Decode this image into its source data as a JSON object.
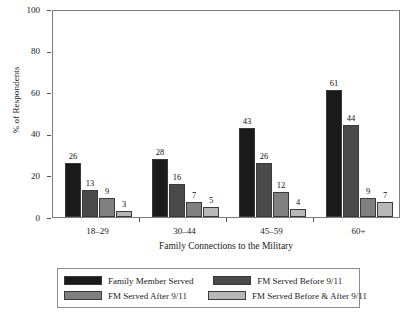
{
  "chart_data": {
    "type": "bar",
    "title": "",
    "xlabel": "Family Connections to the Military",
    "ylabel": "% of Respondents",
    "categories": [
      "18–29",
      "30–44",
      "45–59",
      "60+"
    ],
    "ylim": [
      0,
      100
    ],
    "yticks": [
      0,
      20,
      40,
      60,
      80,
      100
    ],
    "ytick_labels": [
      "0",
      "20",
      "40",
      "60",
      "80",
      "100"
    ],
    "grid": false,
    "legend_position": "bottom",
    "series": [
      {
        "name": "Family Member Served",
        "color": "#1a1a1a",
        "values": [
          26,
          28,
          43,
          61
        ]
      },
      {
        "name": "FM Served Before 9/11",
        "color": "#4a4a4a",
        "values": [
          13,
          16,
          26,
          44
        ]
      },
      {
        "name": "FM Served After 9/11",
        "color": "#808080",
        "values": [
          9,
          7,
          12,
          9
        ]
      },
      {
        "name": "FM Served Before & After 9/11",
        "color": "#b8b8b8",
        "values": [
          3,
          5,
          4,
          7
        ]
      }
    ]
  },
  "colors": {
    "series_1": "#1a1a1a",
    "series_2": "#4a4a4a",
    "series_3": "#808080",
    "series_4": "#b8b8b8",
    "frame": "#7d7d7d",
    "text": "#1a1a1a",
    "background": "#ffffff"
  }
}
